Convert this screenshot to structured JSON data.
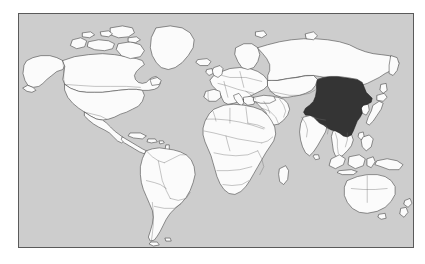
{
  "figure": {
    "kind": "world-map",
    "title": "",
    "caption": "",
    "projection": "equirectangular",
    "frame": {
      "border_color": "#5a5a5a",
      "border_width_px": 1,
      "x": 18,
      "y": 13,
      "width": 396,
      "height": 235
    }
  },
  "colors": {
    "page_background": "#ffffff",
    "ocean": "#cdcdcd",
    "land_fill": "#fbfbfb",
    "land_outline": "#3c3c3c",
    "internal_border": "#6e6e6e",
    "highlight_fill": "#343434",
    "highlight_outline": "#1d1d1d"
  },
  "legend": {
    "visible": false,
    "entries": []
  },
  "map_data": {
    "type": "choropleth",
    "highlighted_countries": [
      "China"
    ],
    "highlight_value_label": "",
    "unhighlighted_label": "",
    "regions_shown": [
      "North America",
      "South America",
      "Greenland",
      "Europe",
      "Africa",
      "Russia",
      "Middle East",
      "South Asia",
      "East Asia",
      "Southeast Asia",
      "Australia",
      "New Zealand",
      "Antarctica excluded"
    ],
    "features": [
      {
        "name": "Alaska",
        "highlighted": false
      },
      {
        "name": "Canada",
        "highlighted": false
      },
      {
        "name": "United States",
        "highlighted": false
      },
      {
        "name": "Mexico",
        "highlighted": false
      },
      {
        "name": "Central America",
        "highlighted": false
      },
      {
        "name": "Caribbean",
        "highlighted": false
      },
      {
        "name": "Greenland",
        "highlighted": false
      },
      {
        "name": "Iceland",
        "highlighted": false
      },
      {
        "name": "Brazil",
        "highlighted": false
      },
      {
        "name": "Argentina",
        "highlighted": false
      },
      {
        "name": "Chile",
        "highlighted": false
      },
      {
        "name": "Peru",
        "highlighted": false
      },
      {
        "name": "Colombia",
        "highlighted": false
      },
      {
        "name": "Venezuela",
        "highlighted": false
      },
      {
        "name": "Bolivia",
        "highlighted": false
      },
      {
        "name": "Paraguay",
        "highlighted": false
      },
      {
        "name": "Uruguay",
        "highlighted": false
      },
      {
        "name": "United Kingdom",
        "highlighted": false
      },
      {
        "name": "Ireland",
        "highlighted": false
      },
      {
        "name": "France",
        "highlighted": false
      },
      {
        "name": "Spain",
        "highlighted": false
      },
      {
        "name": "Portugal",
        "highlighted": false
      },
      {
        "name": "Germany",
        "highlighted": false
      },
      {
        "name": "Poland",
        "highlighted": false
      },
      {
        "name": "Italy",
        "highlighted": false
      },
      {
        "name": "Norway",
        "highlighted": false
      },
      {
        "name": "Sweden",
        "highlighted": false
      },
      {
        "name": "Finland",
        "highlighted": false
      },
      {
        "name": "Turkey",
        "highlighted": false
      },
      {
        "name": "Russia",
        "highlighted": false
      },
      {
        "name": "Kazakhstan",
        "highlighted": false
      },
      {
        "name": "Mongolia",
        "highlighted": false
      },
      {
        "name": "China",
        "highlighted": true
      },
      {
        "name": "India",
        "highlighted": false
      },
      {
        "name": "Pakistan",
        "highlighted": false
      },
      {
        "name": "Iran",
        "highlighted": false
      },
      {
        "name": "Saudi Arabia",
        "highlighted": false
      },
      {
        "name": "Egypt",
        "highlighted": false
      },
      {
        "name": "Libya",
        "highlighted": false
      },
      {
        "name": "Algeria",
        "highlighted": false
      },
      {
        "name": "Morocco",
        "highlighted": false
      },
      {
        "name": "Sudan",
        "highlighted": false
      },
      {
        "name": "Ethiopia",
        "highlighted": false
      },
      {
        "name": "Nigeria",
        "highlighted": false
      },
      {
        "name": "Democratic Republic of the Congo",
        "highlighted": false
      },
      {
        "name": "Angola",
        "highlighted": false
      },
      {
        "name": "South Africa",
        "highlighted": false
      },
      {
        "name": "Madagascar",
        "highlighted": false
      },
      {
        "name": "Japan",
        "highlighted": false
      },
      {
        "name": "Korea",
        "highlighted": false
      },
      {
        "name": "Indonesia",
        "highlighted": false
      },
      {
        "name": "Philippines",
        "highlighted": false
      },
      {
        "name": "Papua New Guinea",
        "highlighted": false
      },
      {
        "name": "Australia",
        "highlighted": false
      },
      {
        "name": "New Zealand",
        "highlighted": false
      }
    ]
  }
}
